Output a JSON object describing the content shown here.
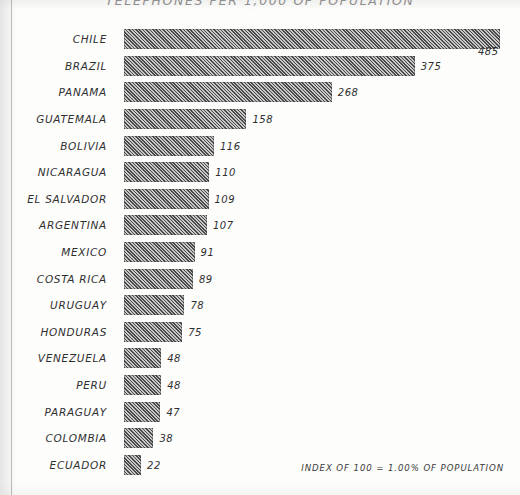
{
  "chart_data": {
    "type": "bar",
    "orientation": "horizontal",
    "title": "TELEPHONES PER 1,000 OF POPULATION",
    "xlabel": "",
    "ylabel": "",
    "xlim": [
      0,
      485
    ],
    "grid": false,
    "legend": null,
    "annotations": [
      "INDEX OF 100 = 1.00% OF POPULATION"
    ],
    "categories": [
      "CHILE",
      "BRAZIL",
      "PANAMA",
      "GUATEMALA",
      "BOLIVIA",
      "NICARAGUA",
      "EL SALVADOR",
      "ARGENTINA",
      "MEXICO",
      "COSTA RICA",
      "URUGUAY",
      "HONDURAS",
      "VENEZUELA",
      "PERU",
      "PARAGUAY",
      "COLOMBIA",
      "ECUADOR"
    ],
    "values": [
      485,
      375,
      268,
      158,
      116,
      110,
      109,
      107,
      91,
      89,
      78,
      75,
      48,
      48,
      47,
      38,
      22
    ],
    "value_labels": [
      "485",
      "375",
      "268",
      "158",
      "116",
      "110",
      "109",
      "107",
      "91",
      "89",
      "78",
      "75",
      "48",
      "48",
      "47",
      "38",
      "22"
    ],
    "bar_color": "#6e6e6e",
    "bar_pattern": "diagonal-hatch"
  },
  "footnote": "INDEX OF 100 = 1.00% OF POPULATION"
}
